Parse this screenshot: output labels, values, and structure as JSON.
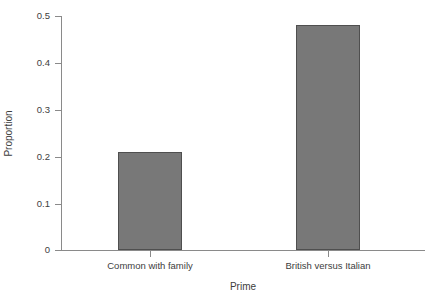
{
  "chart_data": {
    "type": "bar",
    "title": "",
    "subtitle": "",
    "xlabel": "Prime",
    "ylabel": "Proportion",
    "categories": [
      "Common with family",
      "British versus Italian"
    ],
    "values": [
      0.21,
      0.48
    ],
    "series": [
      {
        "name": "Proportion",
        "values": [
          0.21,
          0.48
        ]
      }
    ],
    "ylim": [
      0,
      0.5
    ],
    "yticks": [
      0,
      0.1,
      0.2,
      0.3,
      0.4,
      0.5
    ],
    "ytick_labels": [
      "0",
      "0.1",
      "0.2",
      "0.3",
      "0.4",
      "0.5"
    ],
    "xtick_labels": [
      "Common with family",
      "British versus Italian"
    ],
    "grid": false,
    "legend": null,
    "legend_position": "none",
    "annotations": [],
    "colors": {
      "bar_fill": "#787878",
      "bar_border": "#4f4f4f",
      "axis": "#8a8a8a",
      "text": "#3d3d3d",
      "background": "#ffffff"
    }
  }
}
